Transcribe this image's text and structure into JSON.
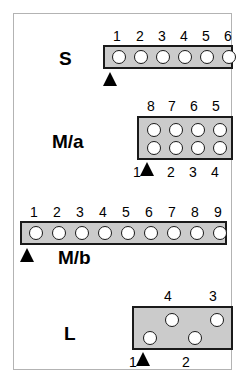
{
  "figure": {
    "title": "",
    "background_color": "#ffffff",
    "frame_color": "#b3b3b3",
    "connector_fill": "#cbcbcb",
    "connector_stroke": "#1a1a1a",
    "pin_fill": "#ffffff",
    "marker_color": "#000000",
    "marker_glyph": "up-triangle"
  },
  "connectors": [
    {
      "id": "S",
      "label": "S",
      "rows": 1,
      "columns": 6,
      "pin_count": 6,
      "top_labels": [
        "1",
        "2",
        "3",
        "4",
        "5",
        "6"
      ],
      "bottom_labels": [],
      "marker_at_pin": "1",
      "marker_side": "bottom"
    },
    {
      "id": "M/a",
      "label": "M/a",
      "rows": 2,
      "columns": 4,
      "pin_count": 8,
      "top_labels": [
        "8",
        "7",
        "6",
        "5"
      ],
      "bottom_labels": [
        "1",
        "2",
        "3",
        "4"
      ],
      "marker_at_pin": "1",
      "marker_side": "bottom"
    },
    {
      "id": "M/b",
      "label": "M/b",
      "rows": 1,
      "columns": 9,
      "pin_count": 9,
      "top_labels": [
        "1",
        "2",
        "3",
        "4",
        "5",
        "6",
        "7",
        "8",
        "9"
      ],
      "bottom_labels": [],
      "marker_at_pin": "1",
      "marker_side": "bottom"
    },
    {
      "id": "L",
      "label": "L",
      "rows": 2,
      "columns": 4,
      "pin_count": 4,
      "top_labels": [
        "4",
        "3"
      ],
      "bottom_labels": [
        "1",
        "2"
      ],
      "marker_at_pin": "1",
      "marker_side": "bottom",
      "staggered": true
    }
  ],
  "labels": {
    "s_name": "S",
    "ma_name": "M/a",
    "mb_name": "M/b",
    "l_name": "L",
    "s_top": [
      "1",
      "2",
      "3",
      "4",
      "5",
      "6"
    ],
    "ma_top": [
      "8",
      "7",
      "6",
      "5"
    ],
    "ma_bottom": [
      "1",
      "2",
      "3",
      "4"
    ],
    "mb_top": [
      "1",
      "2",
      "3",
      "4",
      "5",
      "6",
      "7",
      "8",
      "9"
    ],
    "l_top": [
      "4",
      "3"
    ],
    "l_bottom": [
      "1",
      "2"
    ]
  }
}
